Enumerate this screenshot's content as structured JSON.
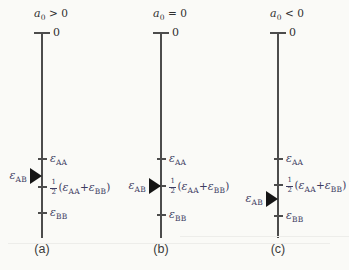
{
  "background": "#fafaf7",
  "colors": {
    "axis": "#4c4c4c",
    "tick": "#4c4c4c",
    "math_label": "#3c3c62",
    "title": "#303030",
    "caption": "#3a3a3a",
    "arrow": "#151515",
    "artifact": "#ededea"
  },
  "axis": {
    "top": 33,
    "bottom": 238,
    "zero_label": "0"
  },
  "artifacts": [
    {
      "x": 180,
      "y": 236,
      "w": 169
    },
    {
      "x": 8,
      "y": 243,
      "w": 322
    }
  ],
  "panels": [
    {
      "id": "a",
      "line_x": 42,
      "caption": "(a)",
      "title": [
        {
          "t": "a",
          "style": "var"
        },
        {
          "t": "0",
          "style": "sub"
        },
        {
          "t": " > 0",
          "style": "plain"
        }
      ],
      "ticks": [
        {
          "name": "epsilon-AA",
          "y": 159,
          "label": [
            {
              "t": "ε",
              "style": "var"
            },
            {
              "t": "AA",
              "style": "sub"
            }
          ]
        },
        {
          "name": "half-sum",
          "y": 187,
          "label": [
            {
              "style": "frac",
              "num": "1",
              "den": "2"
            },
            {
              "t": "(",
              "style": "plain"
            },
            {
              "t": "ε",
              "style": "var"
            },
            {
              "t": "AA",
              "style": "sub"
            },
            {
              "t": "+",
              "style": "plain"
            },
            {
              "t": "ε",
              "style": "var"
            },
            {
              "t": "BB",
              "style": "sub"
            },
            {
              "t": ")",
              "style": "plain"
            }
          ]
        },
        {
          "name": "epsilon-BB",
          "y": 213,
          "label": [
            {
              "t": "ε",
              "style": "var"
            },
            {
              "t": "BB",
              "style": "sub"
            }
          ]
        }
      ],
      "arrow": {
        "y": 176,
        "label": [
          {
            "t": "ε",
            "style": "var"
          },
          {
            "t": "AB",
            "style": "sub"
          }
        ]
      }
    },
    {
      "id": "b",
      "line_x": 161,
      "caption": "(b)",
      "title": [
        {
          "t": "a",
          "style": "var"
        },
        {
          "t": "0",
          "style": "sub"
        },
        {
          "t": " = 0",
          "style": "plain"
        }
      ],
      "ticks": [
        {
          "name": "epsilon-AA",
          "y": 159,
          "label": [
            {
              "t": "ε",
              "style": "var"
            },
            {
              "t": "AA",
              "style": "sub"
            }
          ]
        },
        {
          "name": "half-sum",
          "y": 186,
          "label": [
            {
              "style": "frac",
              "num": "1",
              "den": "2"
            },
            {
              "t": "(",
              "style": "plain"
            },
            {
              "t": "ε",
              "style": "var"
            },
            {
              "t": "AA",
              "style": "sub"
            },
            {
              "t": "+",
              "style": "plain"
            },
            {
              "t": "ε",
              "style": "var"
            },
            {
              "t": "BB",
              "style": "sub"
            },
            {
              "t": ")",
              "style": "plain"
            }
          ]
        },
        {
          "name": "epsilon-BB",
          "y": 215,
          "label": [
            {
              "t": "ε",
              "style": "var"
            },
            {
              "t": "BB",
              "style": "sub"
            }
          ]
        }
      ],
      "arrow": {
        "y": 186,
        "label": [
          {
            "t": "ε",
            "style": "var"
          },
          {
            "t": "AB",
            "style": "sub"
          }
        ]
      }
    },
    {
      "id": "c",
      "line_x": 278,
      "caption": "(c)",
      "title": [
        {
          "t": "a",
          "style": "var"
        },
        {
          "t": "0",
          "style": "sub"
        },
        {
          "t": " < 0",
          "style": "plain"
        }
      ],
      "ticks": [
        {
          "name": "epsilon-AA",
          "y": 159,
          "label": [
            {
              "t": "ε",
              "style": "var"
            },
            {
              "t": "AA",
              "style": "sub"
            }
          ]
        },
        {
          "name": "half-sum",
          "y": 185,
          "label": [
            {
              "style": "frac",
              "num": "1",
              "den": "2"
            },
            {
              "t": "(",
              "style": "plain"
            },
            {
              "t": "ε",
              "style": "var"
            },
            {
              "t": "AA",
              "style": "sub"
            },
            {
              "t": "+",
              "style": "plain"
            },
            {
              "t": "ε",
              "style": "var"
            },
            {
              "t": "BB",
              "style": "sub"
            },
            {
              "t": ")",
              "style": "plain"
            }
          ]
        },
        {
          "name": "epsilon-BB",
          "y": 216,
          "label": [
            {
              "t": "ε",
              "style": "var"
            },
            {
              "t": "BB",
              "style": "sub"
            }
          ]
        }
      ],
      "arrow": {
        "y": 199,
        "label": [
          {
            "t": "ε",
            "style": "var"
          },
          {
            "t": "AB",
            "style": "sub"
          }
        ]
      }
    }
  ]
}
